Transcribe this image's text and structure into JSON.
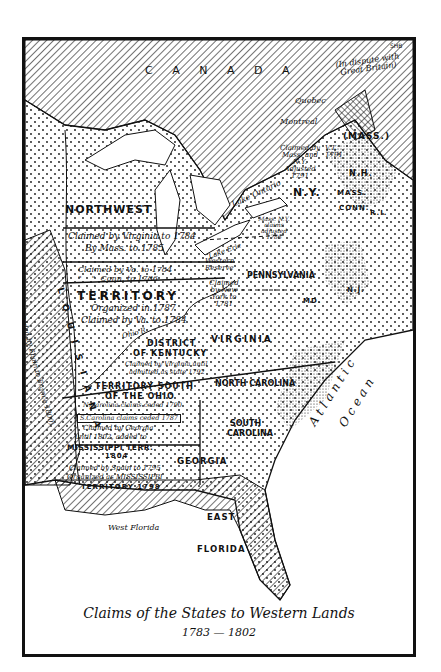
{
  "map": {
    "title": "Claims of the States to Western Lands",
    "years": "1783 — 1802",
    "signature": "SHB",
    "colors": {
      "ink": "#111111",
      "paper": "#ffffff"
    },
    "regions": {
      "canada": "C A N A D A",
      "dispute": "(In dispute with Great Britain)",
      "quebec": "Quebec",
      "montreal": "Montreal",
      "mass_maine": "(MASS.)",
      "vt": "V.T. 1791",
      "claimed_mass_ny": "Claimed by Mass. and N.Y. Adjusted 1791",
      "nh": "N.H.",
      "mass": "MASS.",
      "conn": "CONN.",
      "ri": "R.I.",
      "ny": "N.Y.",
      "lake_ontario": "Lake Ontario",
      "lake_erie": "Lake Erie",
      "mass_ny_claims": "Mass. N.Y. claims adjusted 1786",
      "western_reserve": "Western Reserve",
      "claimed_new_york": "Claimed by New York to 1781",
      "pennsylvania": "PENNSYLVANIA",
      "nj": "N.J.",
      "md": "MD.",
      "virginia": "VIRGINIA",
      "northwest": "NORTHWEST",
      "claim_va_mass_1": "Claimed by Virginia to 1784",
      "claim_va_mass_2": "By Mass. to 1785",
      "claim_va_conn_1": "Claimed by Va. to 1784",
      "claim_va_conn_2": "\"    \"  Conn. to 1786",
      "territory": "TERRITORY",
      "organized_1787": "Organized in 1787",
      "claimed_va_1784": "Claimed by Va. to 1784",
      "ohio_river": "Ohio R.",
      "kentucky_1": "DISTRICT",
      "kentucky_2": "OF KENTUCKY",
      "kentucky_3": "Claimed by Virginia until",
      "kentucky_4": "admitted as state 1792",
      "south_ohio_1": "TERRITORY SOUTH",
      "south_ohio_2": "OF THE OHIO",
      "south_ohio_3": "N.Carolina claims ceded 1790",
      "sc_ceded": "S.Carolina claims ceded 1787",
      "north_carolina": "NORTH CAROLINA",
      "south_carolina_1": "SOUTH",
      "south_carolina_2": "CAROLINA",
      "georgia_claim_1": "Claimed by Georgia",
      "georgia_claim_2": "until 1802, added to",
      "georgia_claim_3": "MISSISSIPPI TERR.",
      "georgia_claim_4": "1804",
      "spain_claim_1": "Claimed by Spain to 1795",
      "spain_claim_2": "Organized as MISSISSIPPI",
      "spain_claim_3": "TERRITORY 1798",
      "georgia": "GEORGIA",
      "west_florida": "West Florida",
      "east_florida_1": "EAST",
      "east_florida_2": "FLORIDA",
      "louisiana_1": "L O U I S I A N A",
      "louisiana_2": "(Ceded by Spain to France 1800)",
      "atlantic": "Atlantic",
      "ocean": "Ocean"
    }
  }
}
